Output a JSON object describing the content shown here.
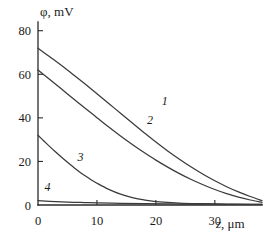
{
  "chart_data": {
    "type": "line",
    "title": "",
    "subtitle": "",
    "xlabel": "z, μm",
    "ylabel": "φ, mV",
    "xlabel_symbol": "z",
    "xlabel_units": ", μm",
    "ylabel_symbol": "φ",
    "ylabel_units": ", mV",
    "xlim": [
      0,
      38
    ],
    "ylim": [
      0,
      84
    ],
    "xticks": [
      0,
      10,
      20,
      30
    ],
    "yticks": [
      0,
      20,
      40,
      60,
      80
    ],
    "xtick_labels": [
      "0",
      "10",
      "20",
      "30"
    ],
    "ytick_labels": [
      "0",
      "20",
      "40",
      "60",
      "80"
    ],
    "grid": false,
    "legend": "inline-curve-labels",
    "line_color": "#3a3a3a",
    "axis_color": "#2b2b2b",
    "background_color": "#ffffff",
    "series": [
      {
        "name": "1",
        "label": "1",
        "label_x": 21.5,
        "label_y": 46,
        "x": [
          0,
          2,
          4,
          6,
          8,
          10,
          12,
          14,
          16,
          18,
          20,
          22,
          24,
          26,
          28,
          30,
          32,
          34,
          36,
          38
        ],
        "values": [
          72.0,
          68.0,
          64.0,
          59.8,
          55.5,
          51.1,
          46.6,
          42.1,
          37.6,
          33.2,
          28.9,
          24.8,
          21.0,
          17.4,
          14.1,
          11.1,
          8.4,
          6.0,
          3.9,
          2.0
        ]
      },
      {
        "name": "2",
        "label": "2",
        "label_x": 19.0,
        "label_y": 37,
        "x": [
          0,
          2,
          4,
          6,
          8,
          10,
          12,
          14,
          16,
          18,
          20,
          22,
          24,
          26,
          28,
          30,
          32,
          34,
          36,
          38
        ],
        "values": [
          62.0,
          57.6,
          53.2,
          48.8,
          44.4,
          40.1,
          35.8,
          31.7,
          27.8,
          24.1,
          20.6,
          17.4,
          14.4,
          11.7,
          9.3,
          7.1,
          5.2,
          3.6,
          2.3,
          1.2
        ]
      },
      {
        "name": "3",
        "label": "3",
        "label_x": 7.2,
        "label_y": 20,
        "x": [
          0,
          1,
          2,
          3,
          4,
          5,
          6,
          7,
          8,
          9,
          10,
          12,
          14,
          16,
          18,
          20,
          24,
          28,
          32,
          36,
          38
        ],
        "values": [
          32.0,
          29.4,
          26.8,
          24.3,
          21.9,
          19.6,
          17.4,
          15.3,
          13.4,
          11.6,
          10.0,
          7.2,
          5.0,
          3.4,
          2.3,
          1.6,
          0.9,
          0.6,
          0.4,
          0.3,
          0.25
        ]
      },
      {
        "name": "4",
        "label": "4",
        "label_x": 1.6,
        "label_y": 6.2,
        "x": [
          0,
          2,
          4,
          6,
          8,
          10,
          14,
          18,
          22,
          26,
          30,
          34,
          38
        ],
        "values": [
          2.0,
          1.7,
          1.45,
          1.25,
          1.1,
          0.95,
          0.75,
          0.6,
          0.5,
          0.42,
          0.35,
          0.3,
          0.26
        ]
      }
    ]
  },
  "figure": {
    "caption": ""
  }
}
